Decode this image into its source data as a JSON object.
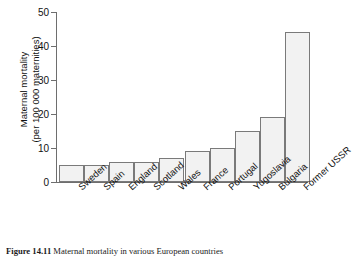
{
  "figure": {
    "caption_label": "Figure 14.11",
    "caption_text": "Maternal mortality in various European countries"
  },
  "axes": {
    "ylabel_line1": "Maternal mortality",
    "ylabel_line2": "(per 100 000 maternities)",
    "xlabel": "",
    "yticks": [
      "0",
      "10",
      "20",
      "30",
      "40",
      "50"
    ]
  },
  "style": {
    "bar_fill": "#f2f2f2",
    "bar_stroke": "#7a7a7a",
    "axis_color": "#6e6e6e",
    "text_color": "#111111",
    "background": "#ffffff"
  },
  "chart_data": {
    "type": "bar",
    "title": "",
    "xlabel": "",
    "ylabel": "Maternal mortality (per 100 000 maternities)",
    "ylim": [
      0,
      50
    ],
    "yticks": [
      0,
      10,
      20,
      30,
      40,
      50
    ],
    "grid": false,
    "legend": "none",
    "categories": [
      "Sweden",
      "Spain",
      "England",
      "Scotland",
      "Wales",
      "France",
      "Portugal",
      "Yugoslavia",
      "Bulgaria",
      "Former USSR"
    ],
    "values": [
      5,
      5,
      6,
      6,
      7,
      9,
      10,
      15,
      19,
      44
    ]
  }
}
